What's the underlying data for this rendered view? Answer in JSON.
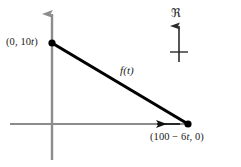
{
  "figure": {
    "type": "math-line-graph",
    "background_color": "#ffffff",
    "axis_color": "#8c8c8c",
    "line_color": "#000000",
    "text_color": "#1a1a1a",
    "axes": {
      "origin": {
        "x": 52,
        "y": 124
      },
      "vertical": {
        "x": 52,
        "top": 12,
        "bottom": 160,
        "arrow": "up"
      },
      "horizontal": {
        "y": 124,
        "left": 10,
        "right": 188,
        "arrow": "none"
      }
    },
    "points": [
      {
        "name": "y-intercept",
        "label": "(0, 10t)",
        "x": 52,
        "y": 43
      },
      {
        "name": "x-intercept",
        "label": "(100 − 6t, 0)",
        "x": 188,
        "y": 124
      }
    ],
    "segment": {
      "label": "f(t)",
      "from": {
        "x": 52,
        "y": 43
      },
      "to": {
        "x": 188,
        "y": 124
      },
      "width": 3
    },
    "direction_arrow": {
      "name": "leftward-motion-arrow",
      "description": "arrowhead pointing left along horizontal axis",
      "tip_x": 152,
      "tail_x": 180,
      "y": 124
    },
    "annotation": {
      "symbol": "ℜ",
      "symbol_name": "fraktur-r-real-numbers",
      "arrow": {
        "name": "upward-indicator-arrow",
        "x": 179,
        "top": 24,
        "bottom": 62,
        "tick_y": 52,
        "tick_half_width": 9
      }
    },
    "labels": {
      "left_point_prefix": "(0, 10",
      "left_point_italic": "t",
      "left_point_suffix": ")",
      "right_point_prefix": "(100 − 6",
      "right_point_italic": "t",
      "right_point_suffix": ", 0)",
      "curve_prefix": "f(",
      "curve_italic": "t",
      "curve_suffix": ")",
      "curve_full": "f(t)"
    }
  }
}
